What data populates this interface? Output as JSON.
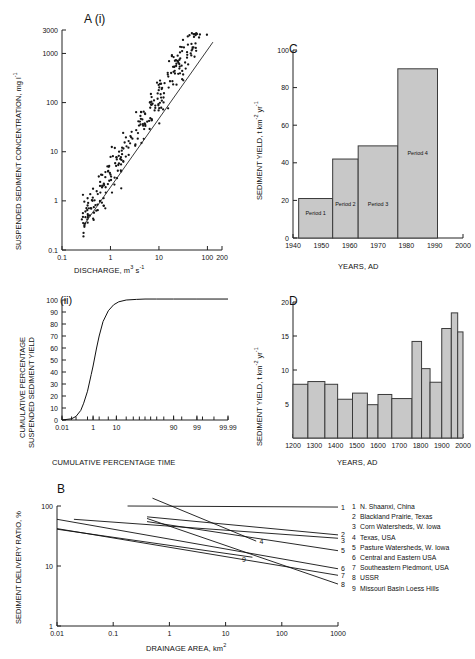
{
  "figure": {
    "panels": [
      "A (i)",
      "(ii)",
      "B",
      "C",
      "D"
    ]
  },
  "chart_data": [
    {
      "id": "A-i",
      "type": "scatter",
      "panel_label": "A (i)",
      "title": "",
      "xlabel": "DISCHARGE, m3 s-1",
      "xlabel_parts": {
        "base": "DISCHARGE, m",
        "sup1": "3",
        "mid": " s",
        "sup2": "-1"
      },
      "ylabel": "SUSPENDED SEDIMENT CONCENTRATION, mg l-1",
      "ylabel_parts": {
        "base": "SUSPENDED SEDIMENT CONCENTRATION, mg l",
        "sup": "-1"
      },
      "xscale": "log",
      "yscale": "log",
      "xlim": [
        0.1,
        200
      ],
      "ylim": [
        0.1,
        3000
      ],
      "xticks": [
        0.1,
        1,
        10,
        100,
        200
      ],
      "xticklabels": [
        "0.1",
        "1",
        "10",
        "100",
        "200"
      ],
      "yticks": [
        0.1,
        1,
        10,
        100,
        1000,
        3000
      ],
      "yticklabels": [
        "0.1",
        "1",
        "10",
        "100",
        "1000",
        "3000"
      ],
      "grid": false,
      "trendline": {
        "x": [
          0.28,
          130
        ],
        "y": [
          0.32,
          1700
        ],
        "description": "rating curve power-law fit"
      },
      "n_points": 300,
      "points_note": "suspended sediment rating curve scatter, strong positive log-log relation with scatter of about +/- 1 order of magnitude"
    },
    {
      "id": "A-ii",
      "type": "line",
      "panel_label": "(ii)",
      "xlabel": "CUMULATIVE PERCENTAGE TIME",
      "ylabel": "CUMULATIVE PERCENTAGE SUSPENDED SEDIMENT YIELD",
      "ylabel_line1": "CUMULATIVE PERCENTAGE",
      "ylabel_line2": "SUSPENDED SEDIMENT YIELD",
      "xscale": "probability",
      "xlim": [
        0.01,
        99.99
      ],
      "ylim": [
        0,
        100
      ],
      "xticks": [
        0.01,
        1,
        10,
        90,
        99,
        99.99
      ],
      "xticklabels": [
        "0.01",
        "1",
        "10",
        "90",
        "99",
        "99.99"
      ],
      "yticks": [
        0,
        10,
        20,
        30,
        40,
        50,
        60,
        70,
        80,
        90,
        100
      ],
      "yticklabels": [
        "0",
        "10",
        "20",
        "30",
        "40",
        "50",
        "60",
        "70",
        "80",
        "90",
        "100"
      ],
      "grid": false,
      "series": [
        {
          "name": "cumulative sediment yield",
          "x": [
            0.01,
            0.05,
            0.1,
            0.2,
            0.3,
            0.5,
            0.8,
            1,
            1.5,
            2,
            3,
            5,
            8,
            12,
            20,
            35,
            50,
            70,
            90,
            99,
            99.99
          ],
          "y": [
            0,
            1,
            3,
            8,
            14,
            24,
            38,
            45,
            60,
            70,
            82,
            91,
            96,
            98.5,
            100,
            100.5,
            100.8,
            100.8,
            100.8,
            100.8,
            100.8
          ]
        }
      ]
    },
    {
      "id": "B",
      "type": "line",
      "panel_label": "B",
      "xlabel": "DRAINAGE AREA, km2",
      "xlabel_parts": {
        "base": "DRAINAGE AREA, km",
        "sup": "2"
      },
      "ylabel": "SEDIMENT DELIVERY RATIO, %",
      "xscale": "log",
      "yscale": "log",
      "xlim": [
        0.01,
        1000
      ],
      "ylim": [
        1,
        100
      ],
      "xticks": [
        0.01,
        0.1,
        1,
        10,
        100,
        1000
      ],
      "xticklabels": [
        "0.01",
        "0.1",
        "1",
        "10",
        "100",
        "1000"
      ],
      "yticks": [
        1,
        10,
        100
      ],
      "yticklabels": [
        "1",
        "10",
        "100"
      ],
      "grid": false,
      "series": [
        {
          "name": "1",
          "label": "N. Shaanxi, China",
          "x": [
            0.18,
            1000
          ],
          "y": [
            100,
            96
          ]
        },
        {
          "name": "2",
          "label": "Blackland Prairie, Texas",
          "x": [
            0.4,
            1000
          ],
          "y": [
            66,
            33
          ]
        },
        {
          "name": "3",
          "label": "Corn Watersheds, W. Iowa",
          "x": [
            0.02,
            1000
          ],
          "y": [
            60,
            29
          ]
        },
        {
          "name": "4",
          "label": "Texas, USA",
          "x": [
            0.5,
            35
          ],
          "y": [
            135,
            26
          ]
        },
        {
          "name": "5",
          "label": "Pasture Watersheds, W. Iowa",
          "x": [
            0.4,
            1000
          ],
          "y": [
            55,
            18
          ]
        },
        {
          "name": "6",
          "label": "Central and Eastern USA",
          "x": [
            0.01,
            1000
          ],
          "y": [
            60,
            9
          ]
        },
        {
          "name": "7",
          "label": "Southeastern Piedmont, USA",
          "x": [
            0.01,
            1000
          ],
          "y": [
            42,
            7
          ]
        },
        {
          "name": "8",
          "label": "USSR",
          "x": [
            0.4,
            1000
          ],
          "y": [
            62,
            5
          ]
        },
        {
          "name": "9",
          "label": "Missouri Basin Loess Hills",
          "x": [
            0.01,
            30
          ],
          "y": [
            41,
            14
          ]
        }
      ],
      "legend_position": "right-outside",
      "legend": [
        {
          "num": "1",
          "text": "N. Shaanxi, China"
        },
        {
          "num": "2",
          "text": "Blackland Prairie, Texas"
        },
        {
          "num": "3",
          "text": "Corn Watersheds, W. Iowa"
        },
        {
          "num": "4",
          "text": "Texas, USA"
        },
        {
          "num": "5",
          "text": "Pasture Watersheds, W. Iowa"
        },
        {
          "num": "6",
          "text": "Central and Eastern USA"
        },
        {
          "num": "7",
          "text": "Southeastern Piedmont, USA"
        },
        {
          "num": "8",
          "text": "USSR"
        },
        {
          "num": "9",
          "text": "Missouri Basin Loess Hills"
        }
      ]
    },
    {
      "id": "C",
      "type": "bar",
      "panel_label": "C",
      "xlabel": "YEARS, AD",
      "ylabel": "SEDIMENT YIELD, t km-2 yr-1",
      "ylabel_parts": {
        "base": "SEDIMENT YIELD, t km",
        "sup1": "-2",
        "mid": " yr",
        "sup2": "-1"
      },
      "xlim": [
        1940,
        2000
      ],
      "ylim": [
        0,
        100
      ],
      "xticks": [
        1940,
        1950,
        1960,
        1970,
        1980,
        1990,
        2000
      ],
      "xticklabels": [
        "1940",
        "1950",
        "1960",
        "1970",
        "1980",
        "1990",
        "2000"
      ],
      "yticks": [
        0,
        20,
        40,
        60,
        80,
        100
      ],
      "yticklabels": [
        "0",
        "20",
        "40",
        "60",
        "80",
        "100"
      ],
      "grid": false,
      "bars": [
        {
          "label": "Period 1",
          "x0": 1942,
          "x1": 1954,
          "value": 21
        },
        {
          "label": "Period 2",
          "x0": 1954,
          "x1": 1963,
          "value": 42
        },
        {
          "label": "Period 3",
          "x0": 1963,
          "x1": 1977,
          "value": 49
        },
        {
          "label": "Period 4",
          "x0": 1977,
          "x1": 1991,
          "value": 90
        }
      ],
      "bar_fill": "#c8c8c8",
      "bar_edge": "#3a3a3a"
    },
    {
      "id": "D",
      "type": "bar",
      "panel_label": "D",
      "xlabel": "YEARS, AD",
      "ylabel": "SEDIMENT YIELD, t km-2 yr-1",
      "ylabel_parts": {
        "base": "SEDIMENT YIELD, t km",
        "sup1": "-2",
        "mid": " yr",
        "sup2": "-1"
      },
      "xlim": [
        1200,
        2000
      ],
      "ylim": [
        0,
        20
      ],
      "xticks": [
        1200,
        1300,
        1400,
        1500,
        1600,
        1700,
        1800,
        1900,
        2000
      ],
      "xticklabels": [
        "1200",
        "1300",
        "1400",
        "1500",
        "1600",
        "1700",
        "1800",
        "1900",
        "2000"
      ],
      "yticks": [
        5,
        10,
        15,
        20
      ],
      "yticklabels": [
        "5",
        "10",
        "15",
        "20"
      ],
      "grid": false,
      "bars": [
        {
          "x0": 1200,
          "x1": 1270,
          "value": 7.9
        },
        {
          "x0": 1270,
          "x1": 1350,
          "value": 8.3
        },
        {
          "x0": 1350,
          "x1": 1410,
          "value": 7.9
        },
        {
          "x0": 1410,
          "x1": 1480,
          "value": 5.7
        },
        {
          "x0": 1480,
          "x1": 1550,
          "value": 6.6
        },
        {
          "x0": 1550,
          "x1": 1600,
          "value": 4.9
        },
        {
          "x0": 1600,
          "x1": 1665,
          "value": 6.4
        },
        {
          "x0": 1665,
          "x1": 1760,
          "value": 5.8
        },
        {
          "x0": 1760,
          "x1": 1805,
          "value": 14.2
        },
        {
          "x0": 1805,
          "x1": 1845,
          "value": 10.2
        },
        {
          "x0": 1845,
          "x1": 1900,
          "value": 8.2
        },
        {
          "x0": 1900,
          "x1": 1945,
          "value": 16.1
        },
        {
          "x0": 1945,
          "x1": 1975,
          "value": 18.4
        },
        {
          "x0": 1975,
          "x1": 2000,
          "value": 15.6
        }
      ],
      "bar_fill": "#c8c8c8",
      "bar_edge": "#3a3a3a"
    }
  ]
}
